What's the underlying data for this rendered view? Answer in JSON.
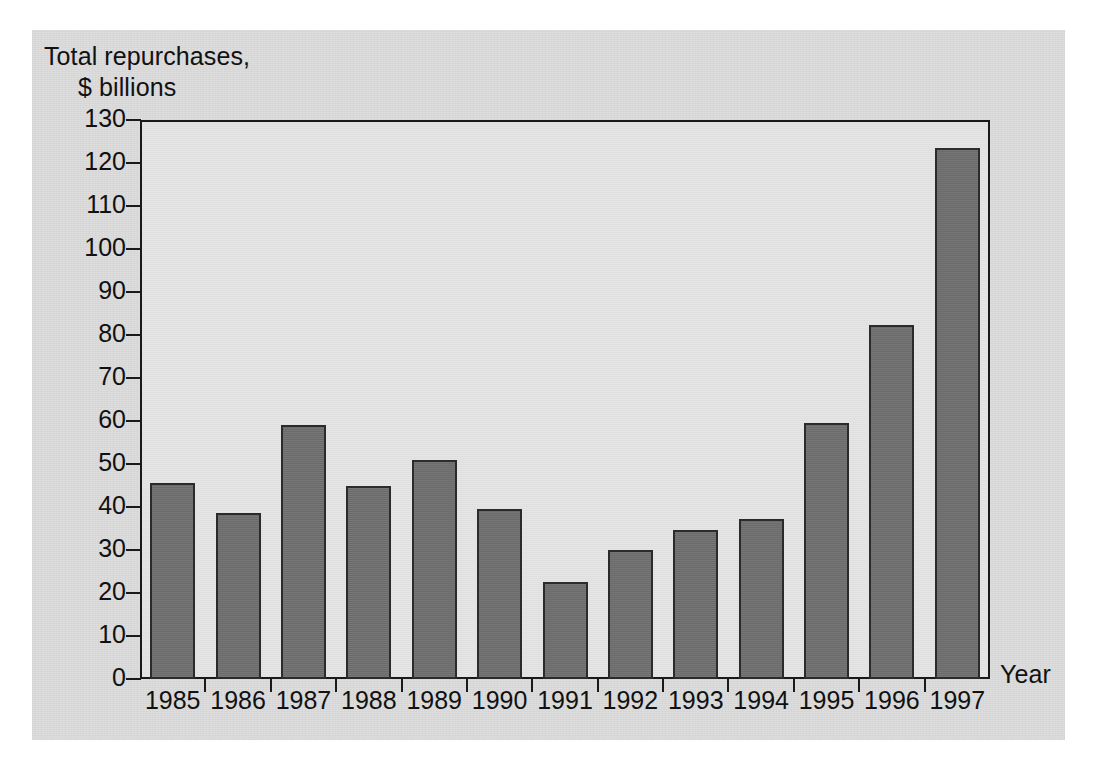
{
  "figure": {
    "background_color": "#dcdcdc",
    "plot_background_color": "#e4e4e4",
    "bar_color": "#6f6f6f",
    "bar_edge_color": "#2b2b2b",
    "axis_color": "#1a1a1a"
  },
  "labels": {
    "ylabel_line1": "Total repurchases,",
    "ylabel_line2": "$ billions",
    "xlabel": "Year"
  },
  "chart_data": {
    "type": "bar",
    "title": "",
    "subtitle": "",
    "xlabel": "Year",
    "ylabel": "Total repurchases, $ billions",
    "categories": [
      "1985",
      "1986",
      "1987",
      "1988",
      "1989",
      "1990",
      "1991",
      "1992",
      "1993",
      "1994",
      "1995",
      "1996",
      "1997"
    ],
    "values": [
      45.5,
      38.5,
      59.0,
      45.0,
      51.0,
      39.5,
      22.6,
      30.0,
      34.6,
      37.2,
      59.5,
      82.3,
      123.5
    ],
    "series": [
      {
        "name": "Total repurchases",
        "values": [
          45.5,
          38.5,
          59.0,
          45.0,
          51.0,
          39.5,
          22.6,
          30.0,
          34.6,
          37.2,
          59.5,
          82.3,
          123.5
        ]
      }
    ],
    "ylim": [
      0,
      130
    ],
    "yticks": [
      0,
      10,
      20,
      30,
      40,
      50,
      60,
      70,
      80,
      90,
      100,
      110,
      120,
      130
    ],
    "ytick_labels": [
      "0",
      "10",
      "20",
      "30",
      "40",
      "50",
      "60",
      "70",
      "80",
      "90",
      "100",
      "110",
      "120",
      "130"
    ],
    "xtick_labels": [
      "1985",
      "1986",
      "1987",
      "1988",
      "1989",
      "1990",
      "1991",
      "1992",
      "1993",
      "1994",
      "1995",
      "1996",
      "1997"
    ],
    "grid": false,
    "legend": null,
    "legend_position": "none",
    "annotations": []
  }
}
